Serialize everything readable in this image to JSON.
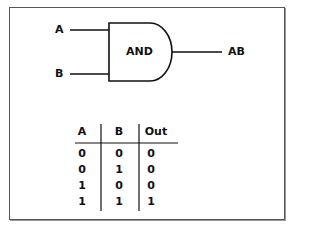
{
  "diagram": {
    "gate": {
      "type": "AND",
      "label": "AND"
    },
    "inputs": [
      {
        "label": "A"
      },
      {
        "label": "B"
      }
    ],
    "output": {
      "label": "AB"
    }
  },
  "truth_table": {
    "headers": [
      "A",
      "B",
      "Out"
    ],
    "rows": [
      [
        "0",
        "0",
        "0"
      ],
      [
        "0",
        "1",
        "0"
      ],
      [
        "1",
        "0",
        "0"
      ],
      [
        "1",
        "1",
        "1"
      ]
    ]
  }
}
